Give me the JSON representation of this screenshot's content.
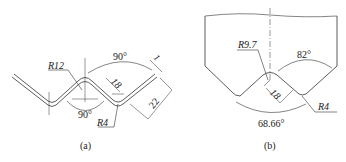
{
  "figure_a": {
    "caption": "(a)",
    "labels": {
      "radius_large": "R12",
      "radius_small": "R4",
      "angle_top": "90°",
      "angle_bottom": "90°",
      "thickness": "1",
      "depth": "18",
      "leg_length": "22"
    }
  },
  "figure_b": {
    "caption": "(b)",
    "labels": {
      "radius_tip": "R9.7",
      "radius_root": "R4",
      "angle_top": "82°",
      "angle_bottom": "68.66°",
      "depth": "18"
    }
  }
}
